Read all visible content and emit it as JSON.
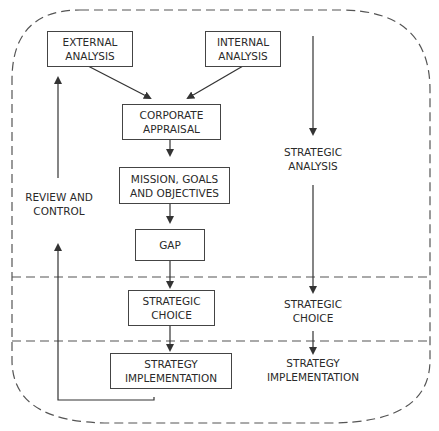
{
  "diagram": {
    "boxes": {
      "external_analysis": [
        "EXTERNAL",
        "ANALYSIS"
      ],
      "internal_analysis": [
        "INTERNAL",
        "ANALYSIS"
      ],
      "corporate_appraisal": [
        "CORPORATE",
        "APPRAISAL"
      ],
      "mission_goals_objectives": [
        "MISSION, GOALS",
        "AND OBJECTIVES"
      ],
      "gap": [
        "GAP"
      ],
      "strategic_choice": [
        "STRATEGIC",
        "CHOICE"
      ],
      "strategy_implementation": [
        "STRATEGY",
        "IMPLEMENTATION"
      ]
    },
    "labels": {
      "review_and_control": [
        "REVIEW AND",
        "CONTROL"
      ],
      "strategic_analysis": [
        "STRATEGIC",
        "ANALYSIS"
      ],
      "strategic_choice_stage": [
        "STRATEGIC",
        "CHOICE"
      ],
      "strategy_implementation_stage": [
        "STRATEGY",
        "IMPLEMENTATION"
      ]
    },
    "line_color": "#444444",
    "border_dash_color": "#555555"
  }
}
